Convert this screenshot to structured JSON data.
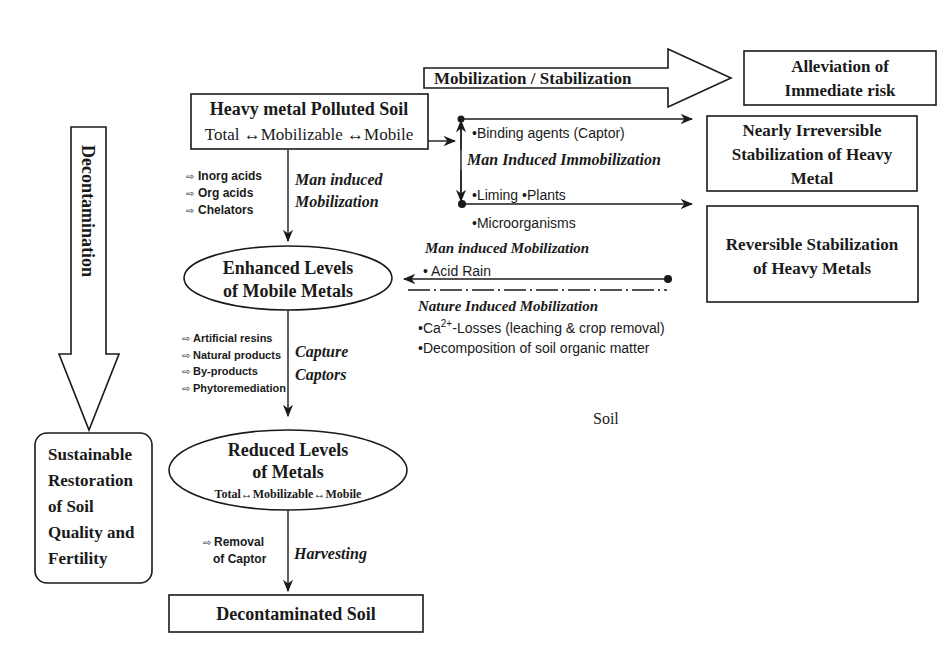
{
  "diagram": {
    "top_arrow": {
      "label": "Mobilization / Stabilization"
    },
    "alleviation_box": {
      "line1": "Alleviation of",
      "line2": "Immediate risk"
    },
    "polluted_soil_box": {
      "title": "Heavy metal Polluted Soil",
      "subtitle": "Total ↔Mobilizable ↔Mobile"
    },
    "decontamination_arrow": {
      "label": "Decontamination"
    },
    "mobilization_agents": [
      "Inorg  acids",
      "Org  acids",
      "Chelators"
    ],
    "man_induced_mobilization_down": {
      "line1": "Man induced",
      "line2": "Mobilization"
    },
    "immobilization": {
      "binding_agents": "•Binding agents (Captor)",
      "label": "Man Induced Immobilization",
      "liming_plants": "•Liming •Plants",
      "microorganisms": "•Microorganisms"
    },
    "irreversible_box": {
      "line1": "Nearly Irreversible",
      "line2": "Stabilization of Heavy",
      "line3": "Metal"
    },
    "reversible_box": {
      "line1": "Reversible Stabilization",
      "line2": "of Heavy Metals"
    },
    "man_induced_mobilization_left": {
      "label": "Man  induced Mobilization",
      "item": "• Acid Rain"
    },
    "nature_induced": {
      "label": "Nature Induced Mobilization",
      "item1_prefix": "•Ca",
      "item1_sup": "2+",
      "item1_suffix": "-Losses (leaching & crop removal)",
      "item2": "•Decomposition of  soil organic matter"
    },
    "enhanced_ellipse": {
      "line1": "Enhanced Levels",
      "line2": "of Mobile Metals"
    },
    "capture_agents": [
      "Artificial resins",
      "Natural products",
      "By-products",
      "Phytoremediation"
    ],
    "capture_label": {
      "line1": "Capture",
      "line2": "Captors"
    },
    "soil_label": "Soil",
    "reduced_ellipse": {
      "line1": "Reduced Levels",
      "line2": "of Metals",
      "line3": "Total↔Mobilizable↔Mobile"
    },
    "removal": {
      "line1": "Removal",
      "line2": "of  Captor"
    },
    "harvesting_label": "Harvesting",
    "decontaminated_box": {
      "label": "Decontaminated Soil"
    },
    "sustainable_box": {
      "lines": [
        "Sustainable",
        "Restoration",
        "of Soil",
        "Quality and",
        "Fertility"
      ]
    },
    "arrow_bullet_glyph": "⇨"
  }
}
